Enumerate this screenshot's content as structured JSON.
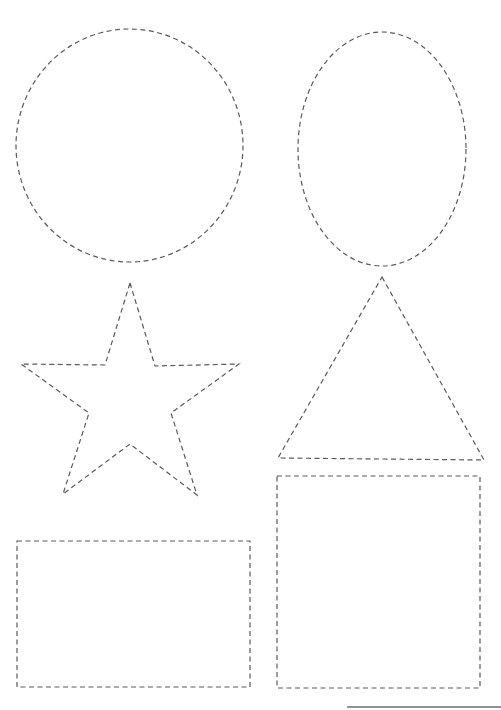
{
  "page": {
    "background": "#ffffff",
    "stroke_color": "#5a5a5a",
    "line_style": "dashed"
  },
  "shapes": [
    {
      "name": "circle",
      "type": "ellipse",
      "cx": 129.5,
      "cy": 145.5,
      "rx": 113.5,
      "ry": 116.5
    },
    {
      "name": "oval",
      "type": "ellipse",
      "cx": 382,
      "cy": 149,
      "rx": 84,
      "ry": 117
    },
    {
      "name": "star",
      "type": "polygon",
      "points": "130,283 155,366 239,364 171,413 197,495 130,444 63,494 89,413 21,364 105,365"
    },
    {
      "name": "triangle",
      "type": "polygon",
      "points": "382,277 484,460 278,458"
    },
    {
      "name": "rectangle",
      "type": "rect",
      "x": 17,
      "y": 541,
      "width": 233,
      "height": 146
    },
    {
      "name": "square",
      "type": "rect",
      "x": 277,
      "y": 476,
      "width": 203,
      "height": 212
    }
  ],
  "footer_line": {
    "x1": 347,
    "y1": 707,
    "x2": 501,
    "y2": 707
  }
}
